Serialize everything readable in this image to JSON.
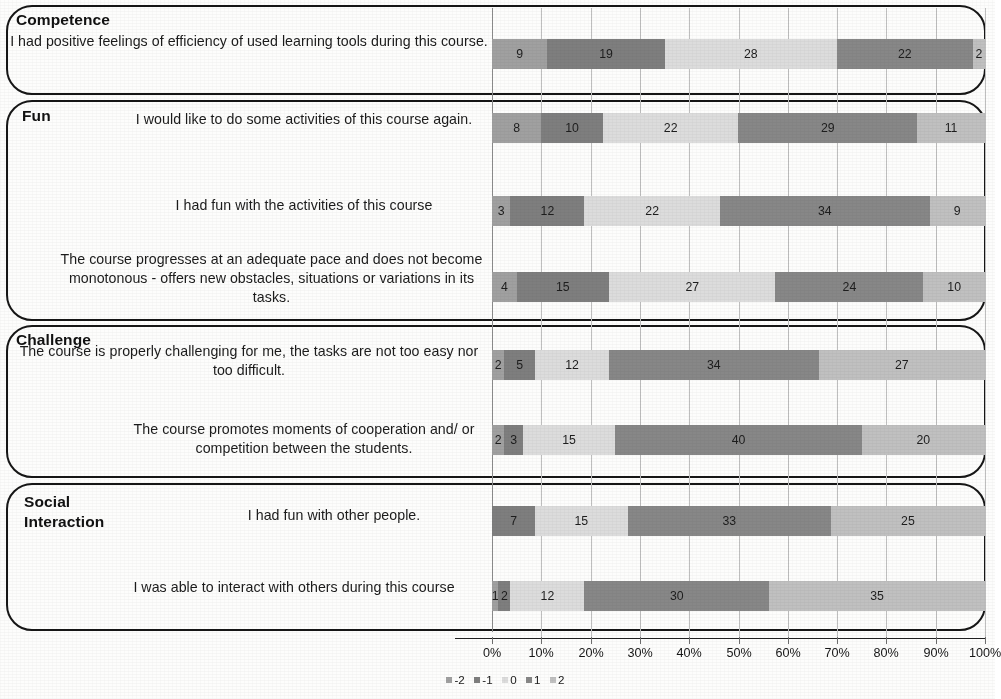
{
  "chart_data": {
    "type": "bar",
    "title": "",
    "subtitle": "",
    "orientation": "horizontal",
    "stacked": true,
    "normalized": "100% stacked",
    "xlabel": "",
    "ylabel": "",
    "xlim": [
      0,
      100
    ],
    "xtick_labels": [
      "0%",
      "10%",
      "20%",
      "30%",
      "40%",
      "50%",
      "60%",
      "70%",
      "80%",
      "90%",
      "100%"
    ],
    "xtick_values": [
      0,
      10,
      20,
      30,
      40,
      50,
      60,
      70,
      80,
      90,
      100
    ],
    "grid": true,
    "legend_position": "bottom-left",
    "legend": [
      "-2",
      "-1",
      "0",
      "1",
      "2"
    ],
    "series": [
      {
        "name": "-2",
        "values": [
          9,
          8,
          3,
          4,
          2,
          2,
          0,
          1
        ]
      },
      {
        "name": "-1",
        "values": [
          19,
          10,
          12,
          15,
          5,
          3,
          7,
          2
        ]
      },
      {
        "name": "0",
        "values": [
          28,
          22,
          22,
          27,
          12,
          15,
          15,
          12
        ]
      },
      {
        "name": "1",
        "values": [
          22,
          29,
          34,
          24,
          34,
          40,
          33,
          30
        ]
      },
      {
        "name": "2",
        "values": [
          2,
          11,
          9,
          10,
          27,
          20,
          25,
          35
        ]
      }
    ],
    "categories": [
      "I had positive feelings of efficiency of used learning tools during this course.",
      "I would like to do some activities of this course again.",
      "I had fun with the activities of this course",
      "The course progresses at an adequate pace and does not become monotonous - offers new obstacles, situations or variations in its tasks.",
      "The course is properly challenging for me, the tasks are not too easy nor too difficult.",
      "The course promotes moments of cooperation and/ or competition between the students.",
      "I had fun with other people.",
      "I was able to interact with others during this course"
    ],
    "colors": {
      "-2": "#a0a0a0",
      "-1": "#7e7e7e",
      "0": "#dcdcdc",
      "1": "#878787",
      "2": "#c0c0c0"
    }
  },
  "groups": [
    {
      "title": "Competence",
      "items": [
        {
          "statement": "I had positive feelings of efficiency of used learning tools during this course.",
          "values": [
            9,
            19,
            28,
            22,
            2
          ],
          "labels": [
            "9",
            "19",
            "28",
            "22",
            "2"
          ]
        }
      ]
    },
    {
      "title": "Fun",
      "items": [
        {
          "statement": "I would like to do some activities of this course again.",
          "values": [
            8,
            10,
            22,
            29,
            11
          ],
          "labels": [
            "8",
            "10",
            "22",
            "29",
            "11"
          ]
        },
        {
          "statement": "I had fun with the activities of this course",
          "values": [
            3,
            12,
            22,
            34,
            9
          ],
          "labels": [
            "3",
            "12",
            "22",
            "34",
            "9"
          ]
        },
        {
          "statement": "The course progresses at an adequate pace and does not become monotonous - offers new obstacles, situations or variations in its tasks.",
          "values": [
            4,
            15,
            27,
            24,
            10
          ],
          "labels": [
            "4",
            "15",
            "27",
            "24",
            "10"
          ]
        }
      ]
    },
    {
      "title": "Challenge",
      "items": [
        {
          "statement": "The course is properly challenging for me, the tasks are not too easy nor too difficult.",
          "values": [
            2,
            5,
            12,
            34,
            27
          ],
          "labels": [
            "2",
            "5",
            "12",
            "34",
            "27"
          ]
        },
        {
          "statement": "The course promotes moments of cooperation and/ or competition between the students.",
          "values": [
            2,
            3,
            15,
            40,
            20
          ],
          "labels": [
            "2",
            "3",
            "15",
            "40",
            "20"
          ]
        }
      ]
    },
    {
      "title": "Social\nInteraction",
      "items": [
        {
          "statement": "I had fun with other people.",
          "values": [
            0,
            7,
            15,
            33,
            25
          ],
          "labels": [
            "0",
            "7",
            "15",
            "33",
            "25"
          ]
        },
        {
          "statement": "I was able to interact with others during this course",
          "values": [
            1,
            2,
            12,
            30,
            35
          ],
          "labels": [
            "1",
            "2",
            "12",
            "30",
            "35"
          ]
        }
      ]
    }
  ],
  "layout": {
    "boxes": [
      {
        "top": 5,
        "height": 90
      },
      {
        "top": 100,
        "height": 221
      },
      {
        "top": 325,
        "height": 153
      },
      {
        "top": 483,
        "height": 148
      }
    ],
    "titles": [
      {
        "left": 16,
        "top": 10
      },
      {
        "left": 22,
        "top": 106
      },
      {
        "left": 16,
        "top": 330
      },
      {
        "left": 24,
        "top": 492
      }
    ],
    "statements": [
      {
        "left": 10,
        "top": 32,
        "width": 478
      },
      {
        "left": 120,
        "top": 110,
        "width": 368
      },
      {
        "left": 120,
        "top": 196,
        "width": 368
      },
      {
        "left": 55,
        "top": 250,
        "width": 433
      },
      {
        "left": 10,
        "top": 342,
        "width": 478
      },
      {
        "left": 120,
        "top": 420,
        "width": 368
      },
      {
        "left": 180,
        "top": 506,
        "width": 308
      },
      {
        "left": 100,
        "top": 578,
        "width": 388
      }
    ],
    "bars": [
      {
        "top": 39
      },
      {
        "top": 113
      },
      {
        "top": 196
      },
      {
        "top": 272
      },
      {
        "top": 350
      },
      {
        "top": 425
      },
      {
        "top": 506
      },
      {
        "top": 581
      }
    ]
  }
}
